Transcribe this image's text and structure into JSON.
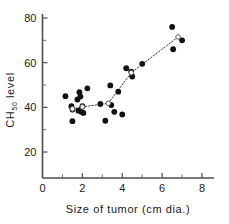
{
  "chart_data": {
    "type": "scatter",
    "title": "",
    "xlabel": "Size of tumor (cm dia.)",
    "ylabel_main": "CH",
    "ylabel_sub": "50",
    "ylabel_tail": " level",
    "ylabel_full": "CH50 level",
    "xlim": [
      0,
      8.6
    ],
    "ylim": [
      0,
      88
    ],
    "xticks": [
      0,
      2,
      4,
      6,
      8
    ],
    "xtick_labels": [
      "0",
      "2",
      "4",
      "6",
      "8"
    ],
    "xticks_minor": [
      1,
      3,
      5,
      7
    ],
    "yticks": [
      20,
      40,
      60,
      80
    ],
    "ytick_labels": [
      "20",
      "40",
      "60",
      "80"
    ],
    "yticks_minor": [
      30,
      50,
      70
    ],
    "grid": false,
    "legend": "none",
    "marker_color": "#111111",
    "axis_color": "#4d4d4d",
    "points": [
      {
        "x": 1.15,
        "y": 45.0
      },
      {
        "x": 1.45,
        "y": 40.5
      },
      {
        "x": 1.5,
        "y": 39.0
      },
      {
        "x": 1.5,
        "y": 33.8
      },
      {
        "x": 1.75,
        "y": 43.5
      },
      {
        "x": 1.8,
        "y": 38.5
      },
      {
        "x": 1.85,
        "y": 46.8
      },
      {
        "x": 1.9,
        "y": 44.8
      },
      {
        "x": 1.95,
        "y": 38.0
      },
      {
        "x": 2.0,
        "y": 40.5
      },
      {
        "x": 2.05,
        "y": 37.5
      },
      {
        "x": 2.25,
        "y": 48.5
      },
      {
        "x": 2.9,
        "y": 41.5
      },
      {
        "x": 3.15,
        "y": 34.0
      },
      {
        "x": 3.4,
        "y": 49.8
      },
      {
        "x": 3.45,
        "y": 41.0
      },
      {
        "x": 3.6,
        "y": 38.0
      },
      {
        "x": 3.8,
        "y": 47.0
      },
      {
        "x": 4.0,
        "y": 36.8
      },
      {
        "x": 4.2,
        "y": 57.5
      },
      {
        "x": 4.45,
        "y": 56.0
      },
      {
        "x": 4.5,
        "y": 53.8
      },
      {
        "x": 5.0,
        "y": 59.5
      },
      {
        "x": 6.5,
        "y": 76.0
      },
      {
        "x": 6.55,
        "y": 66.0
      },
      {
        "x": 7.0,
        "y": 70.0
      }
    ],
    "trend": {
      "style": "dotted",
      "mean_points": [
        {
          "x": 1.5,
          "y": 39.3
        },
        {
          "x": 2.0,
          "y": 40.2
        },
        {
          "x": 3.3,
          "y": 41.8
        },
        {
          "x": 4.45,
          "y": 55.5
        },
        {
          "x": 6.8,
          "y": 71.5
        }
      ]
    }
  }
}
